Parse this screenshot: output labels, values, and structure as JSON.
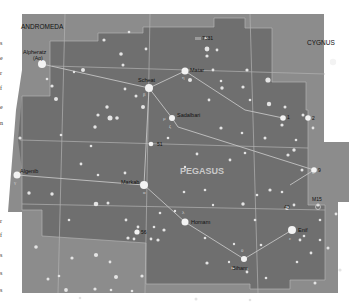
{
  "map": {
    "colors": {
      "page_bg": "#ffffff",
      "sky_outer": "#8a8a8a",
      "sky_inner": "#6e6e6e",
      "boundary": "#b5b5b5",
      "figure_line": "#c8c8c8",
      "star": "#f2f2f2",
      "label_dark": "#111111",
      "label_light": "#d8d8d8"
    },
    "constellation_labels": {
      "andromeda": "ANDROMEDA",
      "cygnus": "CYGNUS",
      "pegasus": "PEGASUS"
    },
    "star_labels": {
      "alpheratz": "Alpheratz",
      "alpheratz_alt": "(Aα)",
      "scheat": "Scheat",
      "matar": "Matar",
      "sadalbari": "Sadalbari",
      "markab": "Markab",
      "algenib": "Algenib",
      "homam": "Homam",
      "enif": "Enif",
      "biham": "Biham",
      "n51": "51",
      "n9": "9",
      "n1": "1",
      "n2": "2",
      "n56": "56",
      "n40": "40",
      "m15": "M15",
      "ngc7331": "7331"
    },
    "greek": {
      "beta": "β",
      "eta": "η",
      "mu": "μ",
      "alpha": "α",
      "gamma": "γ",
      "zeta": "ζ",
      "epsilon": "ε",
      "theta": "θ",
      "lambda": "λ",
      "iota": "ι",
      "kappa": "κ"
    },
    "margin_fragments": [
      "s",
      "e",
      "r",
      "f",
      "e",
      "n",
      "r",
      "f",
      "s",
      "s",
      "s"
    ]
  }
}
